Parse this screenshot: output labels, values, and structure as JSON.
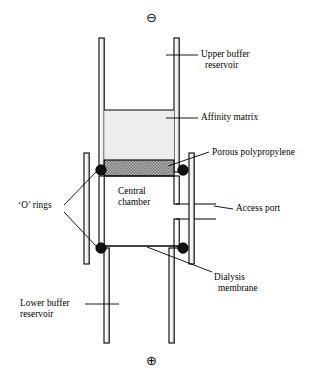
{
  "figure": {
    "kind": "scientific-apparatus-diagram",
    "background_color": "#ffffff",
    "ink_color": "#000000"
  },
  "polarity": {
    "top": {
      "symbol": "⊖",
      "name": "negative-electrode-symbol",
      "x": 147,
      "y": 12
    },
    "bottom": {
      "symbol": "⊕",
      "name": "positive-electrode-symbol",
      "x": 147,
      "y": 355
    }
  },
  "labels": [
    {
      "id": "upper-buffer-reservoir",
      "lines": [
        "Upper buffer",
        "reservoir"
      ],
      "x": 201,
      "y": 50,
      "align": "left"
    },
    {
      "id": "affinity-matrix",
      "lines": [
        "Affinity matrix"
      ],
      "x": 201,
      "y": 114,
      "align": "left"
    },
    {
      "id": "porous-polypropylene",
      "lines": [
        "Porous polypropylene"
      ],
      "x": 212,
      "y": 149,
      "align": "left"
    },
    {
      "id": "access-port",
      "lines": [
        "Access port"
      ],
      "x": 236,
      "y": 205,
      "align": "left"
    },
    {
      "id": "o-rings",
      "lines": [
        "‘O’ rings"
      ],
      "x": 18,
      "y": 202,
      "align": "left"
    },
    {
      "id": "central-chamber",
      "lines": [
        "Central",
        "chamber"
      ],
      "x": 117,
      "y": 188,
      "align": "left"
    },
    {
      "id": "dialysis-membrane",
      "lines": [
        "Dialysis",
        "membrane"
      ],
      "x": 214,
      "y": 274,
      "align": "left"
    },
    {
      "id": "lower-buffer-reservoir",
      "lines": [
        "Lower buffer",
        "reservoir"
      ],
      "x": 20,
      "y": 300,
      "align": "left"
    }
  ],
  "components": {
    "upper_tube": {
      "name": "upper-buffer-reservoir-tube",
      "left_wall_x": 99,
      "right_wall_x": 179,
      "wall_thickness": 5,
      "top_y": 38,
      "bottom_y": 172
    },
    "affinity_matrix": {
      "name": "affinity-matrix-fill",
      "fill": "#ececec",
      "x": 104,
      "y": 110,
      "width": 75,
      "height": 50
    },
    "porous_polypropylene": {
      "name": "porous-polypropylene-frit",
      "pattern": "checkerboard",
      "fill": "#9a9a9a",
      "x": 104,
      "y": 160,
      "width": 75,
      "height": 16
    },
    "central_chamber": {
      "name": "central-chamber-body",
      "left_x": 104,
      "right_x": 179,
      "top_y": 172,
      "bottom_y": 245
    },
    "access_port": {
      "name": "access-port-spout",
      "x": 186,
      "y": 203,
      "length": 42,
      "gap": 16
    },
    "outer_sleeve_left": {
      "name": "outer-sleeve-left",
      "x": 84,
      "top_y": 153,
      "bottom_y": 264,
      "thickness": 5
    },
    "outer_sleeve_right": {
      "name": "outer-sleeve-right",
      "x": 190,
      "top_y": 153,
      "bottom_y": 264,
      "thickness": 5
    },
    "lower_tube": {
      "name": "lower-buffer-reservoir-tube",
      "left_wall_x": 104,
      "right_wall_x": 174,
      "wall_thickness": 5,
      "top_y": 245,
      "bottom_y": 343
    },
    "dialysis_membrane": {
      "name": "dialysis-membrane-line",
      "x1": 104,
      "x2": 179,
      "y": 245
    },
    "o_rings": {
      "name": "o-ring-seal",
      "radius": 5.2,
      "fill": "#000000",
      "positions": [
        {
          "cx": 101,
          "cy": 170
        },
        {
          "cx": 183,
          "cy": 170
        },
        {
          "cx": 101,
          "cy": 248
        },
        {
          "cx": 183,
          "cy": 248
        }
      ]
    }
  },
  "leader_lines": [
    {
      "id": "leader-upper-buffer",
      "x1": 198,
      "y1": 54,
      "x2": 167,
      "y2": 54
    },
    {
      "id": "leader-affinity-matrix",
      "x1": 198,
      "y1": 118,
      "x2": 167,
      "y2": 118
    },
    {
      "id": "leader-porous-polypropylene",
      "x1": 209,
      "y1": 152,
      "x2": 169,
      "y2": 165
    },
    {
      "id": "leader-access-port",
      "x1": 233,
      "y1": 209,
      "x2": 215,
      "y2": 205
    },
    {
      "id": "leader-o-ring-upper",
      "x1": 64,
      "y1": 204,
      "x2": 98,
      "y2": 172
    },
    {
      "id": "leader-o-ring-lower",
      "x1": 64,
      "y1": 213,
      "x2": 98,
      "y2": 247
    },
    {
      "id": "leader-dialysis-membrane",
      "x1": 211,
      "y1": 273,
      "x2": 148,
      "y2": 246
    },
    {
      "id": "leader-lower-buffer",
      "x1": 84,
      "y1": 304,
      "x2": 117,
      "y2": 304
    }
  ]
}
